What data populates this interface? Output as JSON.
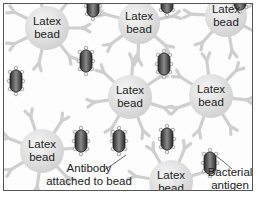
{
  "diagram": {
    "colors": {
      "background": "#fdfdfd",
      "border": "#555555",
      "bead_fill": "#e4e4e4",
      "bead_highlight": "#f6f6f6",
      "antibody": "#cfcfcf",
      "antigen_dark": "#2a2a2a",
      "antigen_mid": "#8a8a8a",
      "text": "#222222"
    },
    "beads": [
      {
        "label": "Latex bead",
        "cx": 43,
        "cy": 24,
        "r": 22
      },
      {
        "label": "Latex bead",
        "cx": 135,
        "cy": 19,
        "r": 21
      },
      {
        "label": "Latex bead",
        "cx": 222,
        "cy": 12,
        "r": 21
      },
      {
        "label": "Latex bead",
        "cx": 126,
        "cy": 93,
        "r": 22
      },
      {
        "label": "Latex bead",
        "cx": 207,
        "cy": 92,
        "r": 22
      },
      {
        "label": "Latex bead",
        "cx": 38,
        "cy": 147,
        "r": 22
      },
      {
        "label": "Latex bead",
        "cx": 167,
        "cy": 178,
        "r": 22
      }
    ],
    "antigens": [
      {
        "cx": 89,
        "cy": 2
      },
      {
        "cx": 163,
        "cy": -2
      },
      {
        "cx": 236,
        "cy": -5
      },
      {
        "cx": 12,
        "cy": 77
      },
      {
        "cx": 82,
        "cy": 57
      },
      {
        "cx": 160,
        "cy": 60
      },
      {
        "cx": 115,
        "cy": 137
      },
      {
        "cx": 163,
        "cy": 135
      },
      {
        "cx": 206,
        "cy": 159
      },
      {
        "cx": 77,
        "cy": 137
      }
    ],
    "annotations": [
      {
        "id": "antibody",
        "text_line1": "Antibody",
        "text_line2": "attached to bead"
      },
      {
        "id": "antigen",
        "text_line1": "Bacterial",
        "text_line2": "antigen"
      }
    ]
  }
}
